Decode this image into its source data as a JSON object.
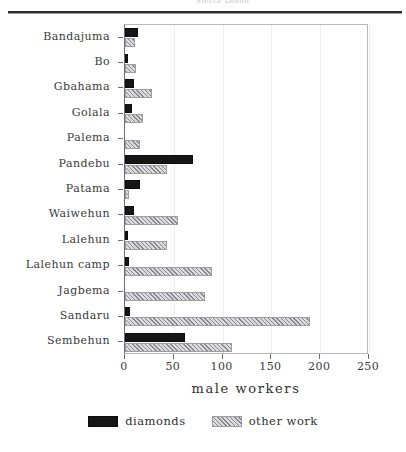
{
  "header": {
    "cropped_text": "Sierra Leone"
  },
  "axis": {
    "x_title": "male workers",
    "x_ticks": [
      0,
      50,
      100,
      150,
      200,
      250
    ]
  },
  "legend": {
    "items": [
      {
        "label": "diamonds",
        "swatch": "black-solid-swatch",
        "color": "#161616"
      },
      {
        "label": "other work",
        "swatch": "hatched-gray-swatch",
        "color": "#dcdcdf"
      }
    ]
  },
  "chart_data": {
    "type": "bar",
    "orientation": "horizontal",
    "title": "",
    "xlabel": "male workers",
    "ylabel": "",
    "xlim": [
      0,
      250
    ],
    "grid": true,
    "legend_position": "bottom",
    "categories": [
      "Bandajuma",
      "Bo",
      "Gbahama",
      "Golala",
      "Palema",
      "Pandebu",
      "Patama",
      "Waiwehun",
      "Lalehun",
      "Lalehun camp",
      "Jagbema",
      "Sandaru",
      "Sembehun"
    ],
    "series": [
      {
        "name": "diamonds",
        "color": "#161616",
        "values": [
          13,
          3,
          9,
          7,
          0,
          70,
          15,
          9,
          3,
          4,
          0,
          5,
          61
        ]
      },
      {
        "name": "other work",
        "color": "#dcdcdf",
        "values": [
          10,
          11,
          28,
          18,
          15,
          43,
          4,
          54,
          43,
          89,
          82,
          190,
          110
        ]
      }
    ]
  }
}
